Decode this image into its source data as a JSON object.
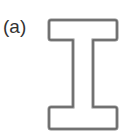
{
  "figure": {
    "label": "(a)",
    "shape": "I-beam cross-section outline",
    "stroke_color": "#6e6e6e"
  }
}
